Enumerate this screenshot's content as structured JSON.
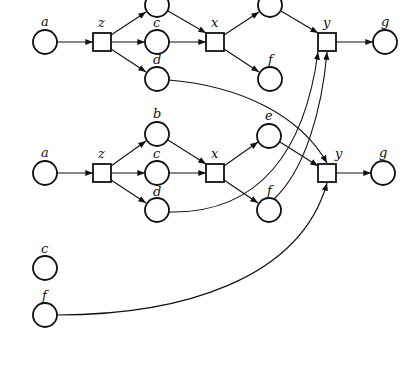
{
  "diagram": {
    "type": "petri-net",
    "nets": [
      {
        "name": "upper-net",
        "places": [
          {
            "id": "a",
            "label": "a",
            "x": 45,
            "y": 42
          },
          {
            "id": "b",
            "label": "",
            "x": 157,
            "y": 5
          },
          {
            "id": "c",
            "label": "c",
            "x": 157,
            "y": 42
          },
          {
            "id": "d",
            "label": "d",
            "x": 157,
            "y": 79
          },
          {
            "id": "e",
            "label": "",
            "x": 270,
            "y": 5
          },
          {
            "id": "f",
            "label": "f",
            "x": 270,
            "y": 79
          },
          {
            "id": "g",
            "label": "g",
            "x": 385,
            "y": 42
          }
        ],
        "transitions": [
          {
            "id": "z",
            "label": "z",
            "x": 102,
            "y": 42
          },
          {
            "id": "x",
            "label": "x",
            "x": 215,
            "y": 42
          },
          {
            "id": "y",
            "label": "y",
            "x": 327,
            "y": 42
          }
        ]
      },
      {
        "name": "lower-net",
        "places": [
          {
            "id": "a",
            "label": "a",
            "x": 45,
            "y": 173
          },
          {
            "id": "b",
            "label": "b",
            "x": 157,
            "y": 134
          },
          {
            "id": "c",
            "label": "c",
            "x": 157,
            "y": 173
          },
          {
            "id": "d",
            "label": "d",
            "x": 157,
            "y": 210
          },
          {
            "id": "e",
            "label": "e",
            "x": 269,
            "y": 136
          },
          {
            "id": "f",
            "label": "f",
            "x": 269,
            "y": 210
          },
          {
            "id": "g",
            "label": "g",
            "x": 383,
            "y": 173
          }
        ],
        "transitions": [
          {
            "id": "z",
            "label": "z",
            "x": 102,
            "y": 173
          },
          {
            "id": "x",
            "label": "x",
            "x": 215,
            "y": 173
          },
          {
            "id": "y",
            "label": "y",
            "x": 327,
            "y": 173
          }
        ]
      },
      {
        "name": "isolated-places",
        "places": [
          {
            "id": "c",
            "label": "c",
            "x": 45,
            "y": 268
          },
          {
            "id": "f",
            "label": "f",
            "x": 45,
            "y": 315
          }
        ]
      }
    ],
    "cross_arcs": [
      {
        "from": "upper.d",
        "to": "lower.y"
      },
      {
        "from": "lower.d",
        "to": "upper.y"
      },
      {
        "from": "lower.f",
        "to": "upper.y"
      },
      {
        "from": "isolated.f",
        "to": "lower.y"
      }
    ],
    "labels": {
      "u_a": "a",
      "u_z": "z",
      "u_c": "c",
      "u_d": "d",
      "u_x": "x",
      "u_f": "f",
      "u_y": "y",
      "u_g": "g",
      "l_a": "a",
      "l_z": "z",
      "l_b": "b",
      "l_c": "c",
      "l_d": "d",
      "l_x": "x",
      "l_e": "e",
      "l_f": "f",
      "l_y": "y",
      "l_g": "g",
      "i_c": "c",
      "i_f": "f"
    }
  }
}
